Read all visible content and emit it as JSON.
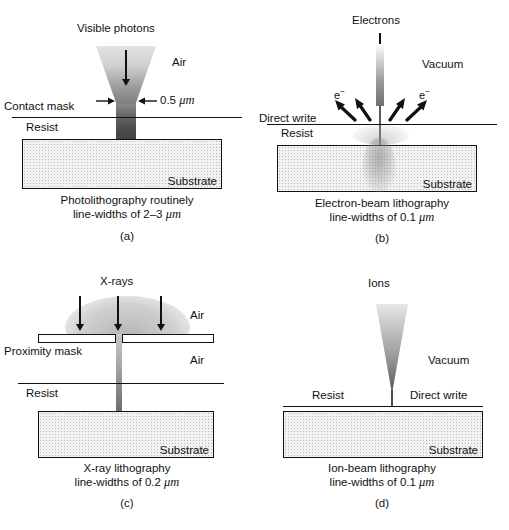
{
  "figure": {
    "type": "diagram",
    "panels": [
      {
        "letter": "(a)",
        "beam_label": "Visible photons",
        "medium_label": "Air",
        "mask_label": "Contact mask",
        "resist_label": "Resist",
        "substrate_label": "Substrate",
        "dimension_label": "0.5",
        "dimension_unit": "μm",
        "caption_line1": "Photolithography routinely",
        "caption_line2_prefix": "line-widths of 2–3",
        "caption_unit": "μm"
      },
      {
        "letter": "(b)",
        "beam_label": "Electrons",
        "medium_label": "Vacuum",
        "write_label": "Direct write",
        "resist_label": "Resist",
        "substrate_label": "Substrate",
        "scatter_label_left": "e−",
        "scatter_label_right": "e−",
        "caption_line1": "Electron-beam lithography",
        "caption_line2_prefix": "line-widths of 0.1",
        "caption_unit": "μm"
      },
      {
        "letter": "(c)",
        "beam_label": "X-rays",
        "medium_label_upper": "Air",
        "medium_label_lower": "Air",
        "mask_label": "Proximity mask",
        "resist_label": "Resist",
        "substrate_label": "Substrate",
        "caption_line1": "X-ray lithography",
        "caption_line2_prefix": "line-widths of 0.2",
        "caption_unit": "μm"
      },
      {
        "letter": "(d)",
        "beam_label": "Ions",
        "medium_label": "Vacuum",
        "write_label": "Direct write",
        "resist_label": "Resist",
        "substrate_label": "Substrate",
        "caption_line1": "Ion-beam lithography",
        "caption_line2_prefix": "line-widths of 0.1",
        "caption_unit": "μm"
      }
    ],
    "colors": {
      "ink": "#111111",
      "substrate_fill": "#f2f2f2",
      "beam_dark": "#4a4a4a",
      "beam_light": "#e2e2e2"
    }
  }
}
